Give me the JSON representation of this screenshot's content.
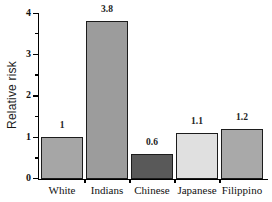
{
  "chart_data": {
    "type": "bar",
    "title": "",
    "xlabel": "",
    "ylabel": "Relative risk",
    "categories": [
      "White",
      "Indians",
      "Chinese",
      "Japanese",
      "Filippino"
    ],
    "values": [
      1,
      3.8,
      0.6,
      1.1,
      1.2
    ],
    "value_labels": [
      "1",
      "3.8",
      "0.6",
      "1.1",
      "1.2"
    ],
    "y_ticks": [
      "0",
      "1",
      "2",
      "3",
      "4"
    ],
    "ylim": [
      0,
      4
    ],
    "grid": false,
    "legend": "none",
    "bar_colors": [
      "#a6a6a6",
      "#9c9c9c",
      "#595959",
      "#e0e0e0",
      "#a9a9a9"
    ],
    "bar_border_color": "#1c1c1c",
    "axis_color": "#000000",
    "background_color": "#ffffff"
  }
}
